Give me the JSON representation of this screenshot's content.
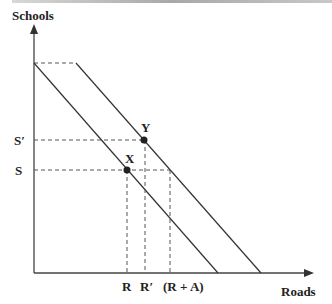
{
  "diagram": {
    "y_axis_label": "Schools",
    "x_axis_label": "Roads",
    "y_ticks": [
      {
        "label": "S′",
        "y": 140
      },
      {
        "label": "S",
        "y": 170
      }
    ],
    "x_ticks": [
      {
        "label": "R",
        "x": 127
      },
      {
        "label": "R′",
        "x": 145
      },
      {
        "label": "(R + A)",
        "x": 170
      }
    ],
    "points": [
      {
        "label": "Y",
        "x": 144,
        "y": 140
      },
      {
        "label": "X",
        "x": 127,
        "y": 170
      }
    ],
    "lines": [
      {
        "name": "inner-budget-line",
        "from": [
          34,
          63
        ],
        "to": [
          218,
          273
        ]
      },
      {
        "name": "outer-budget-line",
        "from": [
          76,
          63
        ],
        "to": [
          261,
          273
        ]
      }
    ],
    "colors": {
      "line": "#333333",
      "text": "#222222"
    }
  }
}
